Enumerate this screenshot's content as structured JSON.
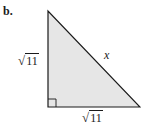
{
  "figure": {
    "part_label": "b.",
    "left_side": {
      "sign": "√",
      "radicand": "11"
    },
    "bottom_side": {
      "sign": "√",
      "radicand": "11"
    },
    "hypotenuse_label": "x",
    "colors": {
      "fill": "#e6e6e6",
      "stroke": "#1a1a1a"
    }
  }
}
